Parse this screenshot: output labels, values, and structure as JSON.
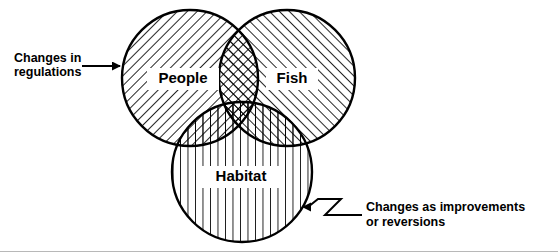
{
  "diagram": {
    "type": "venn-3-circle",
    "title": "",
    "background_color": "#ffffff",
    "line_color": "#000000",
    "sets": [
      {
        "id": "people",
        "label": "People",
        "hatch": "diagonal-backslash",
        "cx": 190,
        "cy": 78,
        "r": 68,
        "label_x": 183,
        "label_y": 79,
        "label_size": 15
      },
      {
        "id": "fish",
        "label": "Fish",
        "hatch": "diagonal-forwardslash",
        "cx": 287,
        "cy": 78,
        "r": 68,
        "label_x": 292,
        "label_y": 79,
        "label_size": 15
      },
      {
        "id": "habitat",
        "label": "Habitat",
        "hatch": "vertical",
        "cx": 242,
        "cy": 172,
        "r": 70,
        "label_x": 241,
        "label_y": 177,
        "label_size": 15
      }
    ],
    "annotations": [
      {
        "id": "changes-in-regulations",
        "lines": [
          "Changes in",
          "regulations"
        ],
        "text_x": 14,
        "text_y": 62,
        "line_height": 14,
        "arrow_direction": "right",
        "arrow_style": "straight",
        "arrow_from_x": 82,
        "arrow_from_y": 66,
        "arrow_to_x": 125,
        "arrow_to_y": 66,
        "target_set": "people"
      },
      {
        "id": "changes-as-improvements-or-reversions",
        "lines": [
          "Changes as improvements",
          "or reversions"
        ],
        "text_x": 366,
        "text_y": 211,
        "line_height": 15,
        "arrow_direction": "left",
        "arrow_style": "zigzag",
        "arrow_from_x": 362,
        "arrow_from_y": 215,
        "arrow_to_x": 303,
        "arrow_to_y": 207,
        "target_set": "habitat"
      }
    ]
  }
}
